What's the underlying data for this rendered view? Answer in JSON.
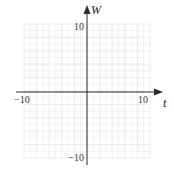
{
  "chart_data": {
    "type": "line",
    "title": "",
    "xlabel": "t",
    "ylabel": "W",
    "xlim": [
      -10,
      10
    ],
    "ylim": [
      -10,
      10
    ],
    "grid": true,
    "grid_step": 2,
    "tick_labels": {
      "x_min": "−10",
      "x_max": "10",
      "y_max": "10",
      "y_min": "−10"
    },
    "series": []
  },
  "colors": {
    "axis": "#2a2a2a",
    "grid": "#e6e6e6",
    "background": "#ffffff"
  }
}
